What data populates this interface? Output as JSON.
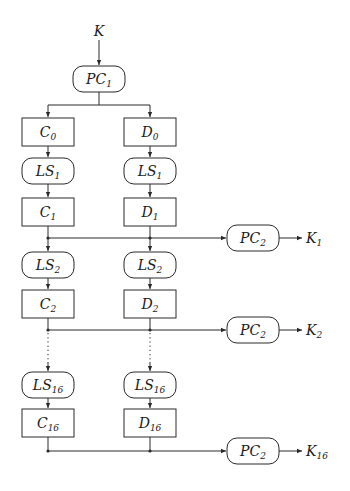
{
  "diagram": {
    "input": {
      "base": "K",
      "sub": ""
    },
    "pc1": {
      "base": "PC",
      "sub": "1"
    },
    "c_column": [
      {
        "base": "C",
        "sub": "0"
      },
      {
        "base": "C",
        "sub": "1"
      },
      {
        "base": "C",
        "sub": "2"
      },
      {
        "base": "C",
        "sub": "16"
      }
    ],
    "d_column": [
      {
        "base": "D",
        "sub": "0"
      },
      {
        "base": "D",
        "sub": "1"
      },
      {
        "base": "D",
        "sub": "2"
      },
      {
        "base": "D",
        "sub": "16"
      }
    ],
    "shifts": [
      {
        "base": "LS",
        "sub": "1"
      },
      {
        "base": "LS",
        "sub": "2"
      },
      {
        "base": "LS",
        "sub": "16"
      }
    ],
    "pc2": [
      {
        "base": "PC",
        "sub": "2"
      },
      {
        "base": "PC",
        "sub": "2"
      },
      {
        "base": "PC",
        "sub": "2"
      }
    ],
    "outputs": [
      {
        "base": "K",
        "sub": "1"
      },
      {
        "base": "K",
        "sub": "2"
      },
      {
        "base": "K",
        "sub": "16"
      }
    ],
    "colors": {
      "stroke": "#2a2a2a",
      "text": "#1a1a1a",
      "background": "#ffffff"
    }
  }
}
